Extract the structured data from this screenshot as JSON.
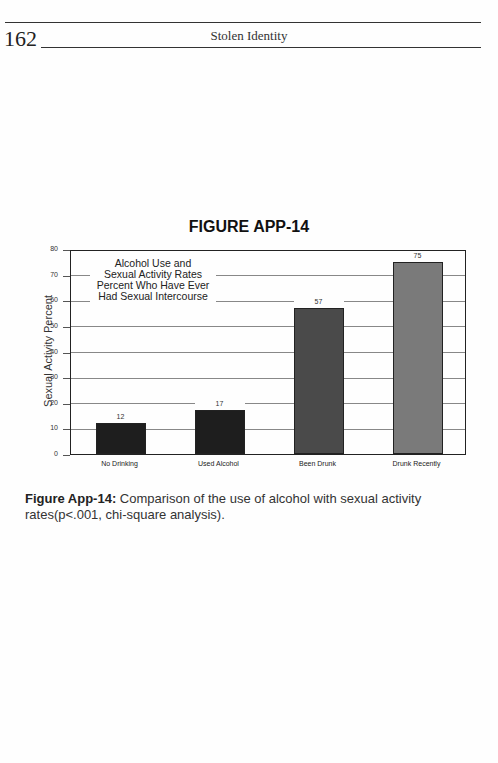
{
  "page_header": {
    "page_number": "162",
    "running_title": "Stolen Identity"
  },
  "figure": {
    "title": "FIGURE APP-14",
    "caption_label": "Figure App-14:",
    "caption_text": " Comparison of the use of alcohol with sexual activity rates(p<.001, chi-square analysis)."
  },
  "chart_data": {
    "type": "bar",
    "title": "Alcohol Use and Sexual Activity Rates Percent Who Have Ever Had Sexual Intercourse",
    "legend_lines": [
      "Alcohol Use and",
      "Sexual Activity Rates",
      "Percent Who Have Ever",
      "Had Sexual Intercourse"
    ],
    "categories": [
      "No Drinking",
      "Used Alcohol",
      "Been Drunk",
      "Drunk Recently"
    ],
    "values": [
      12,
      17,
      57,
      75
    ],
    "value_labels": [
      "12",
      "17",
      "57",
      "75"
    ],
    "colors": [
      "#1e1e1e",
      "#1e1e1e",
      "#4a4a4a",
      "#7a7a7a"
    ],
    "xlabel": "",
    "ylabel": "Sexual Activity Percent",
    "ylim": [
      0,
      80
    ],
    "yticks": [
      "0",
      "10",
      "20",
      "30",
      "40",
      "50",
      "60",
      "70",
      "80"
    ],
    "grid": true
  }
}
